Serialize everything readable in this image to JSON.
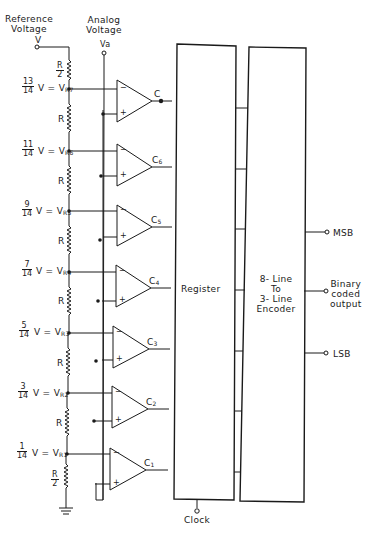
{
  "labels": {
    "reference_voltage": "Reference\nVoltage",
    "reference_voltage_line1": "Reference",
    "reference_voltage_line2": "Voltage",
    "reference_terminal": "V",
    "analog_voltage_line1": "Analog",
    "analog_voltage_line2": "Voltage",
    "analog_terminal": "Va",
    "register": "Register",
    "encoder_line1": "8- Line",
    "encoder_line2": "To",
    "encoder_line3": "3- Line",
    "encoder_line4": "Encoder",
    "msb": "MSB",
    "lsb": "LSB",
    "binary_line1": "Binary",
    "binary_line2": "coded",
    "binary_line3": "output",
    "clock": "Clock"
  },
  "resistors": [
    {
      "label_num": "R",
      "label_den": "2",
      "position": "top"
    },
    {
      "label": "R"
    },
    {
      "label": "R"
    },
    {
      "label": "R"
    },
    {
      "label": "R"
    },
    {
      "label": "R"
    },
    {
      "label": "R"
    },
    {
      "label_num": "R",
      "label_den": "2",
      "position": "bottom"
    }
  ],
  "taps": [
    {
      "num": "13",
      "den": "14",
      "expr": "V =",
      "node": "V",
      "sub": "R7",
      "comparator": "C",
      "comparator_sub": ""
    },
    {
      "num": "11",
      "den": "14",
      "expr": "V =",
      "node": "V",
      "sub": "R6",
      "comparator": "C",
      "comparator_sub": "6"
    },
    {
      "num": "9",
      "den": "14",
      "expr": "V =",
      "node": "V",
      "sub": "R5",
      "comparator": "C",
      "comparator_sub": "5"
    },
    {
      "num": "7",
      "den": "14",
      "expr": "V =",
      "node": "V",
      "sub": "R4",
      "comparator": "C",
      "comparator_sub": "4"
    },
    {
      "num": "5",
      "den": "14",
      "expr": "V =",
      "node": "V",
      "sub": "R3",
      "comparator": "C",
      "comparator_sub": "3"
    },
    {
      "num": "3",
      "den": "14",
      "expr": "V =",
      "node": "V",
      "sub": "R2",
      "comparator": "C",
      "comparator_sub": "2"
    },
    {
      "num": "1",
      "den": "14",
      "expr": "V =",
      "node": "V",
      "sub": "R1",
      "comparator": "C",
      "comparator_sub": "1"
    }
  ],
  "comparator_inputs": {
    "minus": "−",
    "plus": "+"
  },
  "register_to_encoder_lines": 7,
  "colors": {
    "ink": "#1a1a1a",
    "background": "#ffffff"
  }
}
